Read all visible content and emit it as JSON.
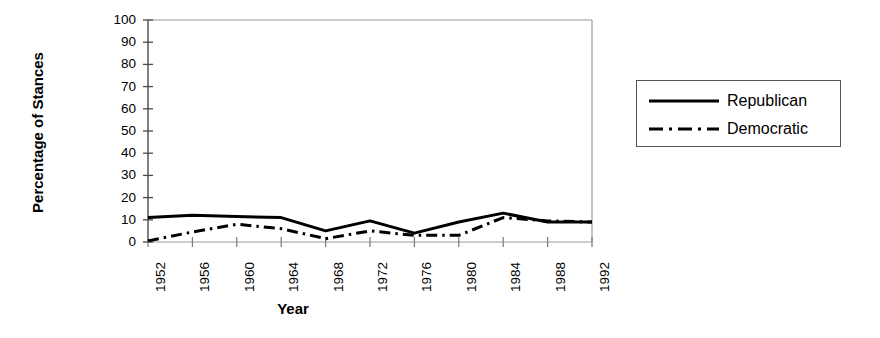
{
  "chart_data": {
    "type": "line",
    "title": "",
    "xlabel": "Year",
    "ylabel": "Percentage of Stances",
    "x": [
      1952,
      1956,
      1960,
      1964,
      1968,
      1972,
      1976,
      1980,
      1984,
      1988,
      1992
    ],
    "categories": [
      "1952",
      "1956",
      "1960",
      "1964",
      "1968",
      "1972",
      "1976",
      "1980",
      "1984",
      "1988",
      "1992"
    ],
    "xlim": [
      1952,
      1992
    ],
    "ylim": [
      0,
      100
    ],
    "yticks": [
      0,
      10,
      20,
      30,
      40,
      50,
      60,
      70,
      80,
      90,
      100
    ],
    "ytick_labels": [
      "0",
      "10",
      "20",
      "30",
      "40",
      "50",
      "60",
      "70",
      "80",
      "90",
      "100"
    ],
    "grid": false,
    "legend_position": "right-outside",
    "series": [
      {
        "name": "Republican",
        "style": "solid",
        "color": "#000000",
        "values": [
          11,
          12,
          11.5,
          11,
          5,
          9.5,
          4,
          9,
          13,
          9,
          9
        ]
      },
      {
        "name": "Democratic",
        "style": "dash-dot",
        "color": "#000000",
        "values": [
          0.5,
          4.5,
          8,
          6,
          1.5,
          5,
          3,
          3,
          11,
          9.5,
          9
        ]
      }
    ]
  },
  "legend": {
    "items": [
      {
        "label": "Republican",
        "style": "solid"
      },
      {
        "label": "Democratic",
        "style": "dash-dot"
      }
    ]
  },
  "axes": {
    "x_title": "Year",
    "y_title": "Percentage of Stances"
  }
}
